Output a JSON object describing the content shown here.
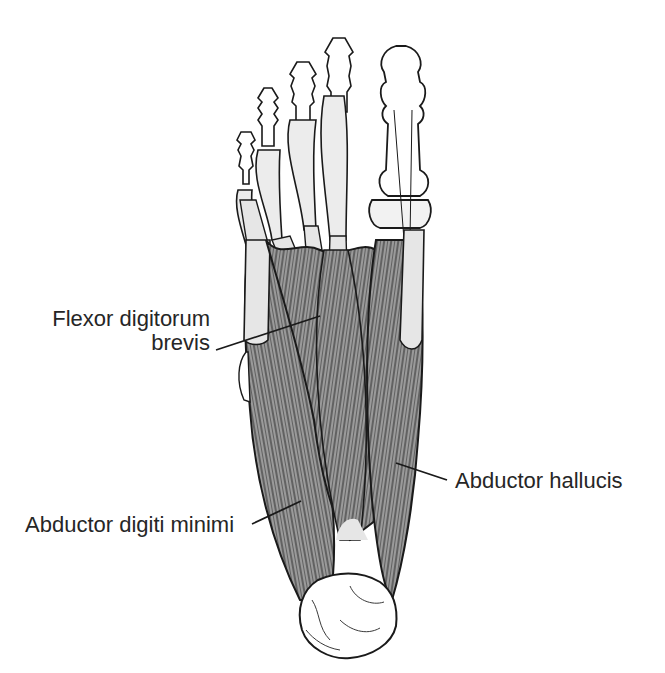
{
  "figure": {
    "colors": {
      "muscle_fill": "#9a9a9a",
      "muscle_fiber": "#2a2a2a",
      "tendon_fill": "#e6e6e6",
      "bone_fill": "#ffffff",
      "outline": "#1a1a1a",
      "label_text": "#262626",
      "background": "#ffffff"
    }
  },
  "labels": {
    "flexor_digitorum_brevis": {
      "line1": "Flexor digitorum",
      "line2": "brevis"
    },
    "abductor_hallucis": "Abductor hallucis",
    "abductor_digiti_minimi": "Abductor digiti minimi"
  }
}
